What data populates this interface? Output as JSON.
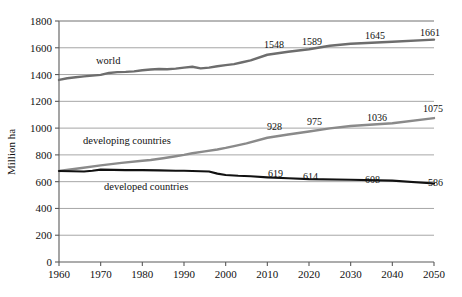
{
  "chart_data": {
    "type": "line",
    "title": "",
    "xlabel": "",
    "ylabel": "Million ha",
    "xlim": [
      1960,
      2050
    ],
    "ylim": [
      0,
      1800
    ],
    "grid": true,
    "legend": "inline-labels",
    "yticks": [
      "0",
      "200",
      "400",
      "600",
      "800",
      "1000",
      "1200",
      "1400",
      "1600",
      "1800"
    ],
    "xticks": [
      "1960",
      "1970",
      "1980",
      "1990",
      "2000",
      "2010",
      "2020",
      "2030",
      "2040",
      "2050"
    ],
    "series": [
      {
        "name": "world",
        "color": "#6d6d6d",
        "label_text": "world",
        "x": [
          1960,
          1962,
          1964,
          1966,
          1968,
          1970,
          1972,
          1974,
          1976,
          1978,
          1980,
          1982,
          1984,
          1986,
          1988,
          1990,
          1992,
          1994,
          1996,
          1998,
          2000,
          2002,
          2004,
          2006,
          2010,
          2015,
          2020,
          2025,
          2030,
          2040,
          2050
        ],
        "values": [
          1360,
          1372,
          1380,
          1386,
          1392,
          1398,
          1412,
          1418,
          1420,
          1424,
          1432,
          1438,
          1442,
          1440,
          1444,
          1452,
          1458,
          1446,
          1452,
          1462,
          1470,
          1478,
          1492,
          1506,
          1548,
          1570,
          1589,
          1615,
          1630,
          1645,
          1661
        ],
        "point_labels": [
          {
            "x": 2010,
            "value": 1548
          },
          {
            "x": 2020,
            "value": 1589
          },
          {
            "x": 2030,
            "value": 1645
          },
          {
            "x": 2050,
            "value": 1661
          }
        ]
      },
      {
        "name": "developing countries",
        "color": "#8a8a8a",
        "label_text": "developing countries",
        "x": [
          1960,
          1965,
          1970,
          1975,
          1980,
          1982,
          1985,
          1988,
          1990,
          1992,
          1995,
          1998,
          2000,
          2002,
          2005,
          2010,
          2015,
          2020,
          2025,
          2030,
          2040,
          2050
        ],
        "values": [
          680,
          700,
          722,
          740,
          756,
          762,
          775,
          790,
          800,
          812,
          826,
          840,
          852,
          866,
          886,
          928,
          952,
          975,
          998,
          1016,
          1036,
          1075
        ],
        "point_labels": [
          {
            "x": 2010,
            "value": 928
          },
          {
            "x": 2020,
            "value": 975
          },
          {
            "x": 2030,
            "value": 1036
          },
          {
            "x": 2050,
            "value": 1075
          }
        ]
      },
      {
        "name": "developed countries",
        "color": "#111111",
        "label_text": "developed countries",
        "x": [
          1960,
          1963,
          1966,
          1968,
          1970,
          1973,
          1976,
          1980,
          1984,
          1988,
          1990,
          1992,
          1994,
          1996,
          1998,
          2000,
          2003,
          2006,
          2010,
          2015,
          2020,
          2030,
          2040,
          2050
        ],
        "values": [
          680,
          678,
          676,
          682,
          690,
          688,
          686,
          686,
          684,
          682,
          682,
          680,
          678,
          676,
          660,
          650,
          644,
          640,
          632,
          625,
          619,
          614,
          608,
          586
        ],
        "point_labels": [
          {
            "x": 2012,
            "value": 619
          },
          {
            "x": 2020,
            "value": 614
          },
          {
            "x": 2032,
            "value": 608
          },
          {
            "x": 2050,
            "value": 586
          }
        ]
      }
    ],
    "series_label_positions": [
      {
        "series": "world",
        "x_px": 96,
        "y_px": 64
      },
      {
        "series": "developing countries",
        "x_px": 83,
        "y_px": 144
      },
      {
        "series": "developed countries",
        "x_px": 104,
        "y_px": 190
      }
    ],
    "point_label_positions": [
      {
        "text": "1548",
        "x_px": 264,
        "y_px": 48
      },
      {
        "text": "1589",
        "x_px": 302,
        "y_px": 45
      },
      {
        "text": "1645",
        "x_px": 365,
        "y_px": 39
      },
      {
        "text": "1661",
        "x_px": 420,
        "y_px": 36
      },
      {
        "text": "928",
        "x_px": 267,
        "y_px": 130
      },
      {
        "text": "975",
        "x_px": 307,
        "y_px": 125
      },
      {
        "text": "1036",
        "x_px": 367,
        "y_px": 121
      },
      {
        "text": "1075",
        "x_px": 423,
        "y_px": 112
      },
      {
        "text": "619",
        "x_px": 268,
        "y_px": 177
      },
      {
        "text": "614",
        "x_px": 303,
        "y_px": 180
      },
      {
        "text": "608",
        "x_px": 365,
        "y_px": 183
      },
      {
        "text": "586",
        "x_px": 428,
        "y_px": 186
      }
    ]
  }
}
